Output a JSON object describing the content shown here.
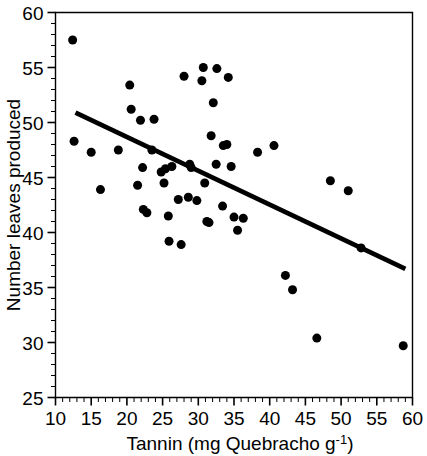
{
  "chart_data": {
    "type": "scatter",
    "title": "",
    "xlabel": "Tannin (mg Quebracho g-1)",
    "xlabel_main": "Tannin (mg Quebracho g",
    "xlabel_sup": "-1",
    "xlabel_tail": ")",
    "ylabel": "Number leaves produced",
    "xlim": [
      10,
      60
    ],
    "ylim": [
      25,
      60
    ],
    "xticks": [
      10,
      15,
      20,
      25,
      30,
      35,
      40,
      45,
      50,
      55,
      60
    ],
    "yticks": [
      25,
      30,
      35,
      40,
      45,
      50,
      55,
      60
    ],
    "xtick_labels": [
      "10",
      "15",
      "20",
      "25",
      "30",
      "35",
      "40",
      "45",
      "50",
      "55",
      "60"
    ],
    "ytick_labels": [
      "25",
      "30",
      "35",
      "40",
      "45",
      "50",
      "55",
      "60"
    ],
    "minor_tick_interval_x": 1,
    "minor_tick_interval_y": 1,
    "grid": false,
    "legend": false,
    "marker": "filled-circle",
    "marker_color": "#000000",
    "marker_size": 9,
    "points": [
      [
        12.4,
        57.5
      ],
      [
        12.6,
        48.3
      ],
      [
        15.0,
        47.3
      ],
      [
        16.3,
        43.9
      ],
      [
        18.8,
        47.5
      ],
      [
        20.4,
        53.4
      ],
      [
        20.6,
        51.2
      ],
      [
        21.5,
        44.3
      ],
      [
        21.9,
        50.2
      ],
      [
        22.2,
        45.9
      ],
      [
        22.3,
        42.1
      ],
      [
        22.8,
        41.8
      ],
      [
        23.5,
        47.5
      ],
      [
        23.8,
        50.3
      ],
      [
        24.8,
        45.5
      ],
      [
        25.2,
        44.5
      ],
      [
        25.4,
        45.8
      ],
      [
        25.8,
        41.5
      ],
      [
        25.9,
        39.2
      ],
      [
        26.3,
        46.0
      ],
      [
        27.2,
        43.0
      ],
      [
        27.6,
        38.9
      ],
      [
        28.0,
        54.2
      ],
      [
        28.6,
        43.2
      ],
      [
        28.8,
        46.2
      ],
      [
        29.0,
        45.9
      ],
      [
        29.8,
        42.9
      ],
      [
        30.5,
        53.8
      ],
      [
        30.7,
        55.0
      ],
      [
        30.9,
        44.5
      ],
      [
        31.2,
        41.0
      ],
      [
        31.5,
        40.9
      ],
      [
        31.8,
        48.8
      ],
      [
        32.1,
        51.8
      ],
      [
        32.5,
        46.2
      ],
      [
        32.6,
        54.9
      ],
      [
        33.4,
        42.4
      ],
      [
        33.5,
        47.9
      ],
      [
        34.0,
        48.0
      ],
      [
        34.2,
        54.1
      ],
      [
        34.6,
        46.0
      ],
      [
        35.0,
        41.4
      ],
      [
        35.5,
        40.2
      ],
      [
        36.3,
        41.3
      ],
      [
        38.3,
        47.3
      ],
      [
        40.6,
        47.9
      ],
      [
        42.2,
        36.1
      ],
      [
        43.2,
        34.8
      ],
      [
        46.6,
        30.4
      ],
      [
        48.5,
        44.7
      ],
      [
        51.0,
        43.8
      ],
      [
        52.8,
        38.6
      ],
      [
        58.7,
        29.7
      ]
    ],
    "trend_line": {
      "type": "linear-fit",
      "x_start": 12.8,
      "y_start": 50.9,
      "x_end": 59.0,
      "y_end": 36.7
    }
  }
}
